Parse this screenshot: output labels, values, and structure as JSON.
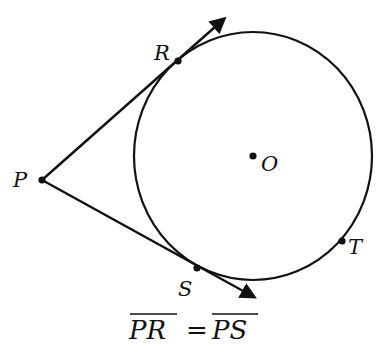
{
  "diagram": {
    "circle": {
      "center_label": "O",
      "cx": 253,
      "cy": 156,
      "rx": 119,
      "ry": 124
    },
    "points": {
      "P": {
        "label": "P",
        "x": 42,
        "y": 180
      },
      "R": {
        "label": "R",
        "x": 178,
        "y": 61
      },
      "S": {
        "label": "S",
        "x": 197,
        "y": 268
      },
      "T": {
        "label": "T",
        "x": 342,
        "y": 241
      },
      "O": {
        "label": "O",
        "x": 253,
        "y": 156
      }
    },
    "rays": [
      {
        "from": "P",
        "through": "R",
        "end": [
          227,
          16
        ]
      },
      {
        "from": "P",
        "through": "S",
        "end": [
          257,
          299
        ]
      }
    ],
    "caption": {
      "left": "PR",
      "equals": "=",
      "right": "PS"
    },
    "colors": {
      "stroke": "#111111",
      "background": "#ffffff"
    }
  }
}
